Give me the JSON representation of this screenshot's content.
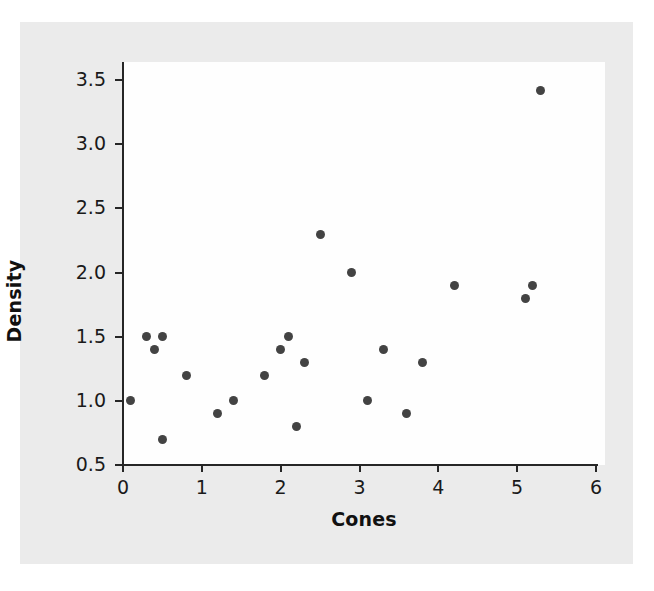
{
  "chart_data": {
    "type": "scatter",
    "title": "",
    "xlabel": "Cones",
    "ylabel": "Density",
    "xlim": [
      0,
      6
    ],
    "ylim": [
      0.5,
      3.5
    ],
    "xticks": [
      "0",
      "1",
      "2",
      "3",
      "4",
      "5",
      "6"
    ],
    "xtick_values": [
      0,
      1,
      2,
      3,
      4,
      5,
      6
    ],
    "yticks": [
      "0.5",
      "1.0",
      "1.5",
      "2.0",
      "2.5",
      "3.0",
      "3.5"
    ],
    "ytick_values": [
      0.5,
      1.0,
      1.5,
      2.0,
      2.5,
      3.0,
      3.5
    ],
    "grid": false,
    "legend": null,
    "marker": "filled-circle",
    "marker_color": "#434343",
    "points": [
      {
        "x": 0.1,
        "y": 1.0
      },
      {
        "x": 0.3,
        "y": 1.5
      },
      {
        "x": 0.4,
        "y": 1.4
      },
      {
        "x": 0.5,
        "y": 1.5
      },
      {
        "x": 0.5,
        "y": 0.7
      },
      {
        "x": 0.8,
        "y": 1.2
      },
      {
        "x": 1.2,
        "y": 0.9
      },
      {
        "x": 1.4,
        "y": 1.0
      },
      {
        "x": 1.8,
        "y": 1.2
      },
      {
        "x": 2.0,
        "y": 1.4
      },
      {
        "x": 2.1,
        "y": 1.5
      },
      {
        "x": 2.2,
        "y": 0.8
      },
      {
        "x": 2.3,
        "y": 1.3
      },
      {
        "x": 2.5,
        "y": 2.3
      },
      {
        "x": 2.9,
        "y": 2.0
      },
      {
        "x": 3.1,
        "y": 1.0
      },
      {
        "x": 3.3,
        "y": 1.4
      },
      {
        "x": 3.6,
        "y": 0.9
      },
      {
        "x": 3.8,
        "y": 1.3
      },
      {
        "x": 4.2,
        "y": 1.9
      },
      {
        "x": 5.1,
        "y": 1.8
      },
      {
        "x": 5.2,
        "y": 1.9
      },
      {
        "x": 5.3,
        "y": 3.42
      }
    ]
  },
  "colors": {
    "page_background": "#ffffff",
    "paper_background": "#ebebeb",
    "plot_background": "#fefefe",
    "axis": "#262626",
    "text": "#1a1a1a",
    "marker": "#434343"
  }
}
